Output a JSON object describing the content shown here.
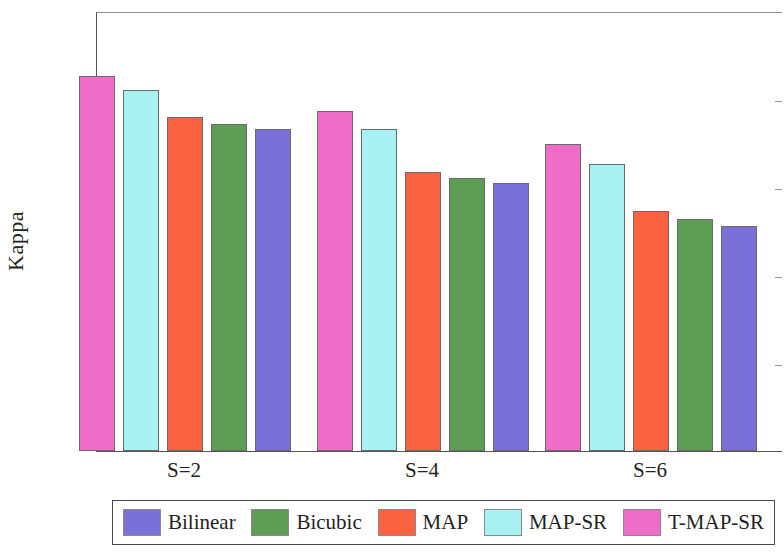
{
  "chart_data": {
    "type": "bar",
    "title": "",
    "xlabel": "",
    "ylabel": "Kappa",
    "categories": [
      "S=2",
      "S=4",
      "S=6"
    ],
    "ylim": [
      0,
      1
    ],
    "yticks": [
      "0",
      "0.2",
      "0.4",
      "0.6",
      "0.8",
      "1"
    ],
    "ytick_values": [
      0,
      0.2,
      0.4,
      0.6,
      0.8,
      1
    ],
    "grid": false,
    "legend_position": "bottom",
    "bar_draw_order": [
      "T-MAP-SR",
      "MAP-SR",
      "MAP",
      "Bicubic",
      "Bilinear"
    ],
    "series": [
      {
        "name": "Bilinear",
        "color": "#7b6fd8",
        "values": [
          0.731,
          0.61,
          0.511
        ]
      },
      {
        "name": "Bicubic",
        "color": "#5d9e54",
        "values": [
          0.744,
          0.62,
          0.527
        ]
      },
      {
        "name": "MAP",
        "color": "#fa6240",
        "values": [
          0.758,
          0.635,
          0.546
        ]
      },
      {
        "name": "MAP-SR",
        "color": "#a8f1f2",
        "values": [
          0.82,
          0.732,
          0.652
        ]
      },
      {
        "name": "T-MAP-SR",
        "color": "#ef6cc8",
        "values": [
          0.853,
          0.772,
          0.697
        ]
      }
    ]
  },
  "legend": {
    "entries": [
      {
        "label": "Bilinear",
        "color": "#7b6fd8"
      },
      {
        "label": "Bicubic",
        "color": "#5d9e54"
      },
      {
        "label": "MAP",
        "color": "#fa6240"
      },
      {
        "label": "MAP-SR",
        "color": "#a8f1f2"
      },
      {
        "label": "T-MAP-SR",
        "color": "#ef6cc8"
      }
    ]
  }
}
